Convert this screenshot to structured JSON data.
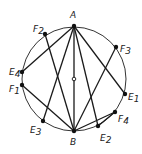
{
  "diagram": {
    "title": "",
    "circle": {
      "cx": 74,
      "cy": 79,
      "r": 52,
      "stroke": "#333333"
    },
    "center": {
      "x": 74,
      "y": 79
    },
    "points": [
      {
        "id": "A",
        "label": "A",
        "sub": "",
        "x": 74,
        "y": 26,
        "lx": 70,
        "ly": 18
      },
      {
        "id": "B",
        "label": "B",
        "sub": "",
        "x": 74,
        "y": 131,
        "lx": 70,
        "ly": 145
      },
      {
        "id": "F2",
        "label": "F",
        "sub": "2",
        "x": 45,
        "y": 34,
        "lx": 33,
        "ly": 32
      },
      {
        "id": "F3",
        "label": "F",
        "sub": "3",
        "x": 116,
        "y": 47,
        "lx": 120,
        "ly": 52
      },
      {
        "id": "E4",
        "label": "E",
        "sub": "4",
        "x": 22,
        "y": 72,
        "lx": 9,
        "ly": 75
      },
      {
        "id": "F1",
        "label": "F",
        "sub": "1",
        "x": 22,
        "y": 85,
        "lx": 9,
        "ly": 92
      },
      {
        "id": "E1",
        "label": "E",
        "sub": "1",
        "x": 125,
        "y": 94,
        "lx": 128,
        "ly": 100
      },
      {
        "id": "F4",
        "label": "F",
        "sub": "4",
        "x": 115,
        "y": 112,
        "lx": 118,
        "ly": 122
      },
      {
        "id": "E3",
        "label": "E",
        "sub": "3",
        "x": 43,
        "y": 121,
        "lx": 30,
        "ly": 133
      },
      {
        "id": "E2",
        "label": "E",
        "sub": "2",
        "x": 98,
        "y": 126,
        "lx": 100,
        "ly": 141
      }
    ],
    "segments": [
      [
        "A",
        "E4"
      ],
      [
        "A",
        "E3"
      ],
      [
        "A",
        "B"
      ],
      [
        "A",
        "E2"
      ],
      [
        "A",
        "E1"
      ],
      [
        "B",
        "F2"
      ],
      [
        "B",
        "F1"
      ],
      [
        "B",
        "F3"
      ],
      [
        "B",
        "F4"
      ],
      [
        "E2",
        "F4"
      ]
    ],
    "line_color": "#1a1a1a",
    "point_color": "#111111"
  }
}
